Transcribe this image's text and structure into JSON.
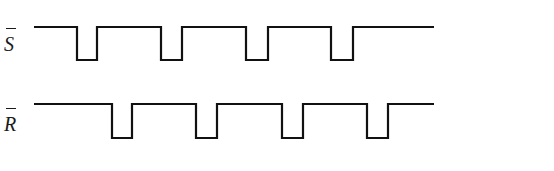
{
  "diagram": {
    "type": "timing-diagram",
    "stroke_color": "#111111",
    "background": "#ffffff",
    "signals": [
      {
        "name": "S",
        "overbar": true,
        "label": "S",
        "high_y": 27,
        "low_y": 60,
        "start_x": 34,
        "end_x": 434,
        "pulses_low": [
          [
            77,
            97
          ],
          [
            161,
            182
          ],
          [
            246,
            268
          ],
          [
            331,
            353
          ]
        ]
      },
      {
        "name": "R",
        "overbar": true,
        "label": "R",
        "high_y": 104,
        "low_y": 138,
        "start_x": 34,
        "end_x": 434,
        "pulses_low": [
          [
            112,
            132
          ],
          [
            196,
            217
          ],
          [
            282,
            303
          ],
          [
            367,
            388
          ]
        ]
      }
    ]
  }
}
